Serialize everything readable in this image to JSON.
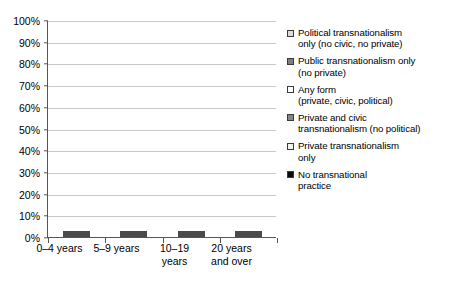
{
  "chart_data": {
    "type": "bar",
    "subtype": "stacked-100-percent-vertical",
    "title": "",
    "xlabel": "",
    "ylabel": "",
    "ylim": [
      0,
      100
    ],
    "grid": true,
    "legend_position": "right",
    "categories": [
      "0–4 years",
      "5–9 years",
      "10–19\nyears",
      "20 years\nand over"
    ],
    "ytick_labels": [
      "0%",
      "10%",
      "20%",
      "30%",
      "40%",
      "50%",
      "60%",
      "70%",
      "80%",
      "90%",
      "100%"
    ],
    "ytick_values": [
      0,
      10,
      20,
      30,
      40,
      50,
      60,
      70,
      80,
      90,
      100
    ],
    "series": [
      {
        "name": "Private transnationalism only",
        "color": "#c8c8c8",
        "values": [
          4.6,
          7.0,
          13.4,
          19.0
        ]
      },
      {
        "name": "Private and civic transnationalism (no political)",
        "color": "#858585",
        "values": [
          4.6,
          9.5,
          11.0,
          11.0
        ]
      },
      {
        "name": "Any form (private, civic, political)",
        "color": "#f7f7f5",
        "values": [
          66.0,
          48.0,
          48.5,
          38.0
        ]
      },
      {
        "name": "Public transnationalism only (no private)",
        "color": "#7e7e7e",
        "values": [
          8.8,
          9.7,
          6.5,
          8.8
        ]
      },
      {
        "name": "No transnational practice",
        "color": "#0b0b0b",
        "values": [
          13.4,
          13.8,
          17.5,
          19.0
        ]
      },
      {
        "name": "Political transnationalism only (no civic, no private)",
        "color": "#dcdcdc",
        "values": [
          2.6,
          2.0,
          3.1,
          4.2
        ]
      }
    ]
  },
  "legend": {
    "items": [
      {
        "label": "Political transnationalism\nonly (no civic, no private)",
        "color": "#dcdcdc",
        "name": "legend-political-only"
      },
      {
        "label": "Public transnationalism only\n(no private)",
        "color": "#7e7e7e",
        "name": "legend-public-only"
      },
      {
        "label": "Any form\n(private, civic, political)",
        "color": "#ffffff",
        "name": "legend-any-form"
      },
      {
        "label": "Private and civic\ntransnationalism (no political)",
        "color": "#858585",
        "name": "legend-private-civic"
      },
      {
        "label": "Private transnationalism\nonly",
        "color": "#f2f2f0",
        "name": "legend-private-only"
      },
      {
        "label": "No transnational\npractice",
        "color": "#0b0b0b",
        "name": "legend-no-practice"
      }
    ]
  }
}
